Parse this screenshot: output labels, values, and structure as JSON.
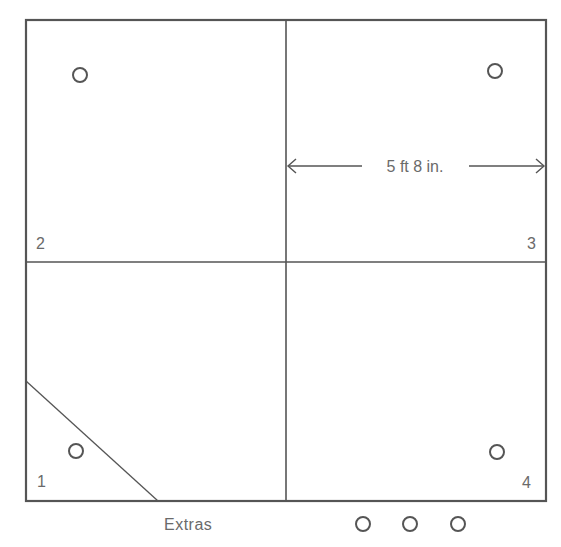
{
  "colors": {
    "line": "#555555",
    "text": "#6a6a6a",
    "background": "#ffffff"
  },
  "diagram": {
    "dimension_label": "5 ft 8 in.",
    "quadrants": [
      {
        "id": "1",
        "label": "1",
        "position": "bottom-left",
        "has_diagonal_cut": true
      },
      {
        "id": "2",
        "label": "2",
        "position": "top-left"
      },
      {
        "id": "3",
        "label": "3",
        "position": "top-right"
      },
      {
        "id": "4",
        "label": "4",
        "position": "bottom-right"
      }
    ],
    "extras_label": "Extras",
    "extras_count": 3
  }
}
